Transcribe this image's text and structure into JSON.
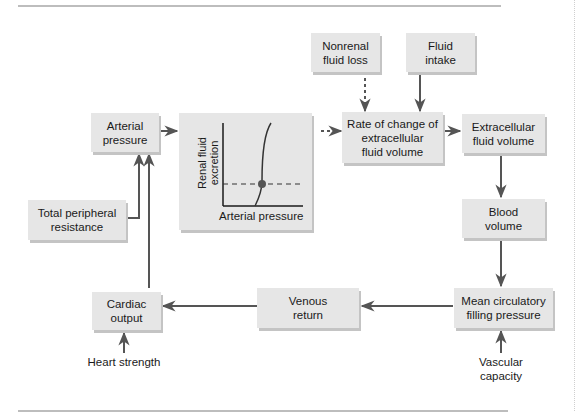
{
  "diagram": {
    "nodes": {
      "arterial_pressure": "Arterial\npressure",
      "nonrenal_fluid_loss": "Nonrenal\nfluid loss",
      "fluid_intake": "Fluid\nintake",
      "rate_of_change": "Rate of change of\nextracellular\nfluid volume",
      "extracellular_fluid_volume": "Extracellular\nfluid volume",
      "total_peripheral_resistance": "Total peripheral\nresistance",
      "blood_volume": "Blood\nvolume",
      "cardiac_output": "Cardiac\noutput",
      "venous_return": "Venous\nreturn",
      "mean_circulatory_filling_pressure": "Mean circulatory\nfilling pressure",
      "heart_strength": "Heart strength",
      "vascular_capacity": "Vascular\ncapacity"
    },
    "inset_graph": {
      "ylabel": "Renal fluid\nexcretion",
      "xlabel": "Arterial pressure"
    },
    "colors": {
      "box_fill": "#e6e6e6",
      "box_shadow": "#c4c4c4",
      "arrow": "#555555"
    }
  }
}
